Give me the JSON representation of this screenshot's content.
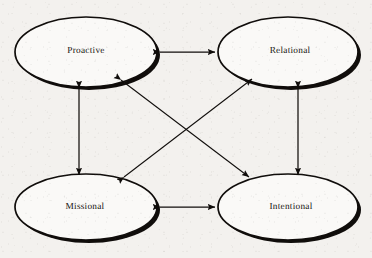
{
  "diagram": {
    "background_color": "#f3f1ee",
    "stroke_color": "#100d0b",
    "fill_color": "#faf9f7",
    "text_color": "#15120f",
    "nodes": [
      {
        "id": "proactive",
        "label": "Proactive",
        "cx": 86,
        "cy": 52,
        "rx": 71,
        "ry": 35
      },
      {
        "id": "relational",
        "label": "Relational",
        "cx": 288,
        "cy": 52,
        "rx": 70,
        "ry": 35
      },
      {
        "id": "missional",
        "label": "Missional",
        "cx": 86,
        "cy": 207,
        "rx": 71,
        "ry": 33
      },
      {
        "id": "intentional",
        "label": "Intentional",
        "cx": 288,
        "cy": 207,
        "rx": 70,
        "ry": 33
      }
    ],
    "edges": [
      {
        "id": "proactive-relational",
        "from": "proactive",
        "to": "relational",
        "style": "double-headed-arrow",
        "orientation": "horizontal",
        "x1": 160,
        "y1": 52,
        "x2": 215,
        "y2": 52
      },
      {
        "id": "missional-intentional",
        "from": "missional",
        "to": "intentional",
        "style": "double-headed-arrow",
        "orientation": "horizontal",
        "x1": 160,
        "y1": 207,
        "x2": 215,
        "y2": 207
      },
      {
        "id": "proactive-missional",
        "from": "proactive",
        "to": "missional",
        "style": "double-headed-arrow",
        "orientation": "vertical",
        "x1": 79,
        "y1": 88,
        "x2": 79,
        "y2": 175
      },
      {
        "id": "relational-intentional",
        "from": "relational",
        "to": "intentional",
        "style": "double-headed-arrow",
        "orientation": "vertical",
        "x1": 298,
        "y1": 88,
        "x2": 298,
        "y2": 175
      },
      {
        "id": "proactive-intentional",
        "from": "proactive",
        "to": "intentional",
        "style": "double-headed-arrow",
        "orientation": "diagonal",
        "x1": 121,
        "y1": 80,
        "x2": 249,
        "y2": 177
      },
      {
        "id": "missional-relational",
        "from": "missional",
        "to": "relational",
        "style": "double-headed-arrow",
        "orientation": "diagonal",
        "x1": 124,
        "y1": 177,
        "x2": 252,
        "y2": 79
      }
    ]
  }
}
